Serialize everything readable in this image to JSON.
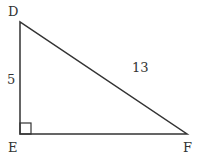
{
  "diagram": {
    "type": "right-triangle",
    "vertices": {
      "D": {
        "label": "D"
      },
      "E": {
        "label": "E"
      },
      "F": {
        "label": "F"
      }
    },
    "sides": {
      "DE": {
        "label": "5"
      },
      "DF": {
        "label": "13"
      }
    },
    "right_angle_at": "E",
    "colors": {
      "stroke": "#333333",
      "background": "#ffffff"
    }
  }
}
